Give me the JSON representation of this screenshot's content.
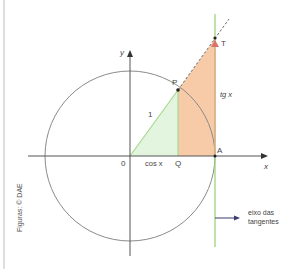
{
  "figure": {
    "credit": "Figuras: © DAE",
    "labels": {
      "y_axis": "y",
      "x_axis": "x",
      "origin": "0",
      "point_p": "P",
      "point_q": "Q",
      "point_a": "A",
      "point_t": "T",
      "radius": "1",
      "cos": "cos x",
      "tan": "tg x",
      "tangent_axis_line1": "eixo das",
      "tangent_axis_line2": "tangentes"
    },
    "colors": {
      "circle": "#8a8a8a",
      "axes": "#555555",
      "tangent_line": "#9fd27a",
      "green_fill": "#e3f5df",
      "green_edge": "#a6d892",
      "orange_fill": "#f8cba8",
      "orange_edge": "#e8a988",
      "point_t_marker": "#d9736a",
      "arrow": "#3b3b6e",
      "frame": "#bbbbbb"
    }
  }
}
